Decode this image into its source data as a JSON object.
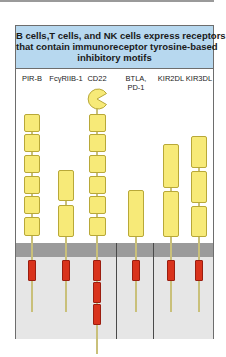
{
  "figure": {
    "title_lines": [
      "B cells,T cells, and NK cells express receptors",
      "that contain immunoreceptor tyrosine-based",
      "inhibitory motifs"
    ],
    "colors": {
      "header_bg": "#b7d8ef",
      "ig_domain": "#f7ea78",
      "itim": "#d9331c",
      "membrane": "#9b9b9b",
      "cytoplasm": "#e6e6e6"
    },
    "receptors": [
      {
        "name": "PIR-B",
        "ig_domains": 6,
        "itims": 1
      },
      {
        "name": "FcγRIIB-1",
        "ig_domains": 2,
        "itims": 1
      },
      {
        "name": "CD22",
        "ig_domains": 6,
        "extra_domain": "sialic-acid-binding (V-like)",
        "itims": 3
      },
      {
        "name": "BTLA,",
        "name_line2": "PD-1",
        "ig_domains": 1,
        "itims": 1
      },
      {
        "name": "KIR2DL",
        "ig_domains": 2,
        "itims": 1
      },
      {
        "name": "KIR3DL",
        "ig_domains": 3,
        "itims": 1
      }
    ],
    "groups": [
      "B cells",
      "T cells",
      "NK cells"
    ]
  }
}
